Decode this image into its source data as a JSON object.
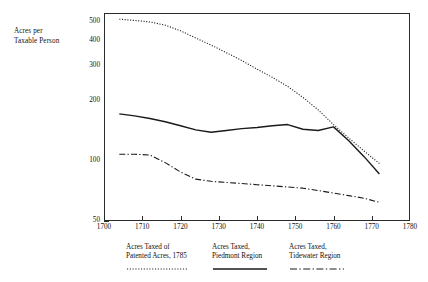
{
  "figure": {
    "y_axis_title_line1": "Acres per",
    "y_axis_title_line2": "Taxable Person"
  },
  "chart_data": {
    "type": "line",
    "title": "",
    "subtitle": "",
    "xlabel": "",
    "ylabel": "Acres per Taxable Person",
    "yscale": "log",
    "xlim": [
      1700,
      1780
    ],
    "ylim": [
      50,
      550
    ],
    "grid": false,
    "legend_position": "bottom",
    "xticks": [
      1700,
      1710,
      1720,
      1730,
      1740,
      1750,
      1760,
      1770,
      1780
    ],
    "xtick_labels": [
      "1700",
      "1710",
      "1720",
      "1730",
      "1740",
      "1750",
      "1760",
      "1770",
      "1780"
    ],
    "yticks": [
      50,
      100,
      200,
      300,
      400,
      500
    ],
    "ytick_labels": [
      "50",
      "100",
      "200",
      "300",
      "400",
      "500"
    ],
    "yticks_minor": [
      60,
      70,
      80,
      90,
      150,
      250,
      350,
      450
    ],
    "series": [
      {
        "name": "Acres Taxed of Patented Acres, 1785",
        "legend_line1": "Acres Taxed of",
        "legend_line2": "Patented Acres, 1785",
        "style": "dotted",
        "color": "#1a1a1a",
        "x": [
          1704,
          1708,
          1712,
          1716,
          1720,
          1724,
          1728,
          1732,
          1736,
          1740,
          1744,
          1748,
          1752,
          1756,
          1760,
          1764,
          1768,
          1772
        ],
        "values": [
          512,
          505,
          496,
          478,
          448,
          412,
          380,
          348,
          318,
          288,
          262,
          236,
          208,
          180,
          152,
          130,
          112,
          97
        ]
      },
      {
        "name": "Acres Taxed, Piedmont Region",
        "legend_line1": "Acres Taxed,",
        "legend_line2": "Piedmont Region",
        "style": "solid",
        "color": "#1a1a1a",
        "x": [
          1704,
          1708,
          1712,
          1716,
          1720,
          1724,
          1728,
          1732,
          1736,
          1740,
          1744,
          1748,
          1752,
          1756,
          1760,
          1764,
          1768,
          1772
        ],
        "values": [
          172,
          168,
          163,
          157,
          150,
          143,
          139,
          142,
          145,
          147,
          150,
          152,
          144,
          142,
          148,
          126,
          105,
          86
        ]
      },
      {
        "name": "Acres Taxed, Tidewater Region",
        "legend_line1": "Acres Taxed,",
        "legend_line2": "Tidewater Region",
        "style": "dashdot",
        "color": "#1a1a1a",
        "x": [
          1704,
          1708,
          1712,
          1716,
          1720,
          1724,
          1728,
          1732,
          1736,
          1740,
          1744,
          1748,
          1752,
          1756,
          1760,
          1764,
          1768,
          1772
        ],
        "values": [
          108,
          108,
          107,
          98,
          88,
          81,
          79,
          78,
          77,
          76,
          75,
          74,
          73,
          71,
          69,
          67,
          65,
          62
        ]
      }
    ]
  }
}
